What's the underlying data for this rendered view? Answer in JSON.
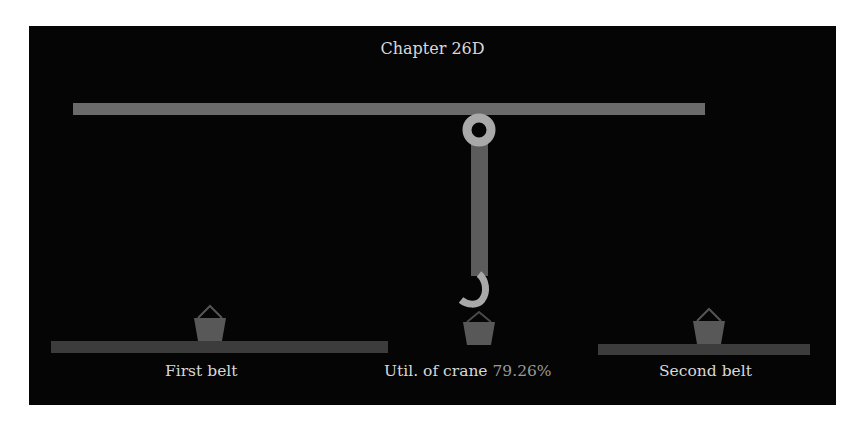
{
  "title": "Chapter 26D",
  "labels": {
    "first_belt": "First belt",
    "second_belt": "Second belt",
    "utilization_prefix": "Util. of crane",
    "utilization_value": "79.26%"
  },
  "colors": {
    "background": "#050505",
    "beam": "#6a6a6a",
    "rope": "#5c5c5c",
    "hook": "#a9a9a9",
    "belt": "#3c3c3c",
    "bucket": "#585858",
    "text": "#d8d8d8",
    "util_value": "#9a9a9a"
  },
  "scene": {
    "crane_utilization_percent": 79.26,
    "buckets": [
      {
        "id": "first-belt-bucket",
        "location": "first belt"
      },
      {
        "id": "crane-hook-bucket",
        "location": "under crane hook"
      },
      {
        "id": "second-belt-bucket",
        "location": "second belt"
      }
    ]
  }
}
